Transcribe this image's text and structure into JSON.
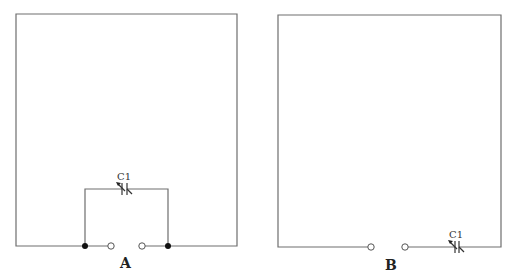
{
  "diagrams": [
    {
      "id": "A",
      "label": "A",
      "capacitor_label": "C1",
      "description": "Rectangular loop with variable capacitor C1 bridging the open gap via a parallel branch"
    },
    {
      "id": "B",
      "label": "B",
      "capacitor_label": "C1",
      "description": "Rectangular loop with open gap and variable capacitor C1 in series on the bottom wire"
    }
  ],
  "colors": {
    "wire": "#6e6e6e",
    "component": "#333333",
    "background": "#ffffff"
  }
}
